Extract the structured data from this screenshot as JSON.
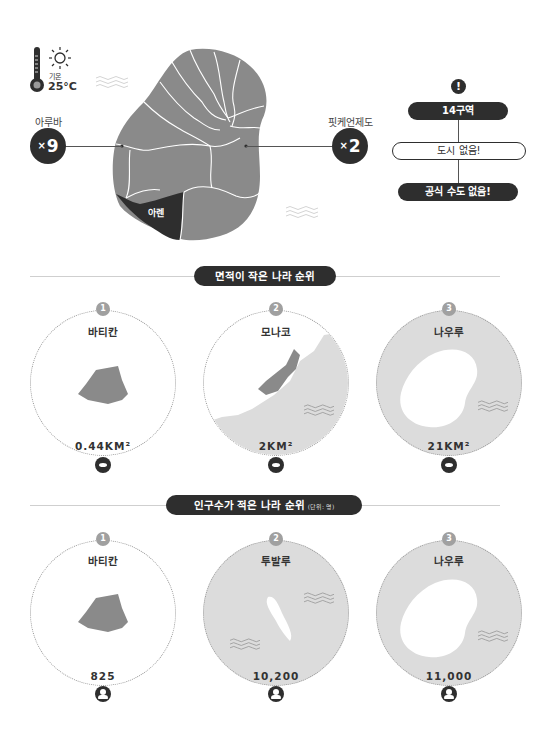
{
  "weather": {
    "label": "기온",
    "temperature": "25°C",
    "icons": [
      "thermometer-icon",
      "sun-icon"
    ]
  },
  "map": {
    "highlighted_region": "아렌",
    "colors": {
      "land": "#8a8a8a",
      "highlight": "#2e2e2e",
      "borders": "#ffffff"
    }
  },
  "comparisons": [
    {
      "name": "아루바",
      "multiplier_prefix": "×",
      "multiplier": "9"
    },
    {
      "name": "핏케언제도",
      "multiplier_prefix": "×",
      "multiplier": "2"
    }
  ],
  "facts": {
    "icon": "exclamation-icon",
    "items": [
      "14구역",
      "도시 없음!",
      "공식 수도 없음!"
    ]
  },
  "area_ranking": {
    "title": "면적이 작은 나라 순위",
    "value_icon": "area-shape-icon",
    "items": [
      {
        "rank": "1",
        "name": "바티칸",
        "value": "0.44KM²"
      },
      {
        "rank": "2",
        "name": "모나코",
        "value": "2KM²"
      },
      {
        "rank": "3",
        "name": "나우루",
        "value": "21KM²"
      }
    ]
  },
  "population_ranking": {
    "title": "인구수가 적은 나라 순위",
    "unit_note": "(단위: 명)",
    "value_icon": "person-icon",
    "items": [
      {
        "rank": "1",
        "name": "바티칸",
        "value": "825"
      },
      {
        "rank": "2",
        "name": "투발루",
        "value": "10,200"
      },
      {
        "rank": "3",
        "name": "나우루",
        "value": "11,000"
      }
    ]
  }
}
